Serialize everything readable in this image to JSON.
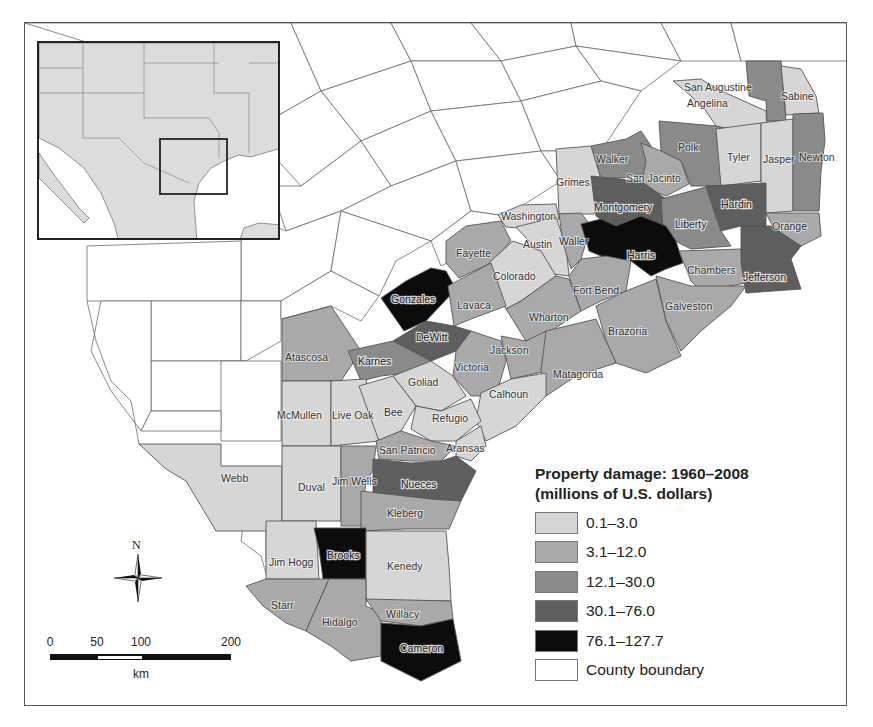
{
  "legend": {
    "title_line1": "Property damage: 1960–2008",
    "title_line2": "(millions of U.S. dollars)",
    "classes": [
      {
        "label": "0.1–3.0",
        "color": "#d6d6d6"
      },
      {
        "label": "3.1–12.0",
        "color": "#a9a9a9"
      },
      {
        "label": "12.1–30.0",
        "color": "#8a8a8a"
      },
      {
        "label": "30.1–76.0",
        "color": "#5e5e5e"
      },
      {
        "label": "76.1–127.7",
        "color": "#0c0c0c"
      },
      {
        "label": "County boundary",
        "color": "#ffffff"
      }
    ]
  },
  "compass": {
    "label": "N"
  },
  "scalebar": {
    "ticks": [
      "0",
      "50",
      "100",
      "200"
    ],
    "unit": "km"
  },
  "inset": {
    "description": "Locator map of south-central United States and Mexico with study area box over southeast Texas"
  },
  "counties": [
    {
      "name": "San Augustine",
      "class": 2
    },
    {
      "name": "Angelina",
      "class": 0
    },
    {
      "name": "Sabine",
      "class": 0
    },
    {
      "name": "Polk",
      "class": 2
    },
    {
      "name": "Tyler",
      "class": 0
    },
    {
      "name": "Jasper",
      "class": 0
    },
    {
      "name": "Newton",
      "class": 2
    },
    {
      "name": "Walker",
      "class": 2
    },
    {
      "name": "San Jacinto",
      "class": 1
    },
    {
      "name": "Grimes",
      "class": 0
    },
    {
      "name": "Montgomery",
      "class": 3
    },
    {
      "name": "Hardin",
      "class": 3
    },
    {
      "name": "Liberty",
      "class": 2
    },
    {
      "name": "Orange",
      "class": 1
    },
    {
      "name": "Washington",
      "class": 0
    },
    {
      "name": "Austin",
      "class": 0
    },
    {
      "name": "Waller",
      "class": 1
    },
    {
      "name": "Harris",
      "class": 4
    },
    {
      "name": "Chambers",
      "class": 1
    },
    {
      "name": "Jefferson",
      "class": 3
    },
    {
      "name": "Fayette",
      "class": 1
    },
    {
      "name": "Colorado",
      "class": 0
    },
    {
      "name": "Fort Bend",
      "class": 1
    },
    {
      "name": "Galveston",
      "class": 1
    },
    {
      "name": "Gonzales",
      "class": 4
    },
    {
      "name": "Lavaca",
      "class": 1
    },
    {
      "name": "Wharton",
      "class": 1
    },
    {
      "name": "Brazoria",
      "class": 1
    },
    {
      "name": "DeWitt",
      "class": 3
    },
    {
      "name": "Atascosa",
      "class": 1
    },
    {
      "name": "Karnes",
      "class": 2
    },
    {
      "name": "Victoria",
      "class": 1
    },
    {
      "name": "Jackson",
      "class": 1
    },
    {
      "name": "Matagorda",
      "class": 1
    },
    {
      "name": "Goliad",
      "class": 0
    },
    {
      "name": "Calhoun",
      "class": 0
    },
    {
      "name": "McMullen",
      "class": 0
    },
    {
      "name": "Live Oak",
      "class": 0
    },
    {
      "name": "Bee",
      "class": 0
    },
    {
      "name": "Refugio",
      "class": 0
    },
    {
      "name": "San Patricio",
      "class": 1
    },
    {
      "name": "Aransas",
      "class": 0
    },
    {
      "name": "Webb",
      "class": 0
    },
    {
      "name": "Duval",
      "class": 0
    },
    {
      "name": "Jim Wells",
      "class": 1
    },
    {
      "name": "Nueces",
      "class": 3
    },
    {
      "name": "Kleberg",
      "class": 1
    },
    {
      "name": "Jim Hogg",
      "class": 0
    },
    {
      "name": "Brooks",
      "class": 4
    },
    {
      "name": "Kenedy",
      "class": 0
    },
    {
      "name": "Starr",
      "class": 1
    },
    {
      "name": "Hidalgo",
      "class": 1
    },
    {
      "name": "Willacy",
      "class": 1
    },
    {
      "name": "Cameron",
      "class": 4
    }
  ]
}
